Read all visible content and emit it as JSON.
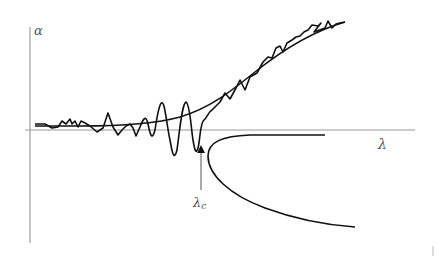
{
  "diagram": {
    "axes": {
      "y_label": "α",
      "x_label": "λ",
      "critical_label": "λ",
      "critical_subscript": "c"
    },
    "colors": {
      "curve": "#111111",
      "axis": "#888888",
      "label": "#555555",
      "background": "#ffffff"
    },
    "elements": [
      "vertical axis (α)",
      "horizontal axis (λ)",
      "noisy fluctuating trajectory",
      "smooth exponential fitted curve",
      "bifurcation branch (C-shaped)",
      "upward arrow marking λc"
    ]
  }
}
